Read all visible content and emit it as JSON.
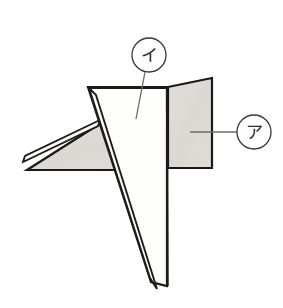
{
  "figure": {
    "canvas": {
      "width": 283,
      "height": 308,
      "background": "#ffffff"
    },
    "style": {
      "outline_color": "#1c1a18",
      "outline_width": 2.2,
      "thin_line_color": "#2b2825",
      "thin_line_width": 1.1,
      "shaded_fill": "#dedbd6",
      "white_fill": "#fdfdfc",
      "leader_color": "#6e6b67",
      "leader_width": 1.2,
      "circle_stroke": "#3a3734",
      "circle_stroke_width": 1.3
    },
    "parts": [
      {
        "id": "right-panel",
        "name": "right shaded panel",
        "fill": "shaded",
        "points": "168,87 212,78 212,168 168,168"
      },
      {
        "id": "left-wing",
        "name": "left shaded wing",
        "fill": "shaded",
        "points": "100,122 148,168 26,168"
      },
      {
        "id": "left-fold-sliver",
        "name": "left folded edge sliver",
        "fill": "white",
        "points": "99,120 24,158 22,163 97,127"
      },
      {
        "id": "center-face",
        "name": "central white triangular face",
        "fill": "white",
        "points": "88,87 167,87 167,285 152,283"
      },
      {
        "id": "tail-sliver",
        "name": "lower tail sliver",
        "fill": "white",
        "points": "90,89 150,281 156,286 96,93"
      }
    ],
    "callouts": [
      {
        "id": "callout-a",
        "label": "ア",
        "romaji": "a",
        "circle": {
          "cx": 254,
          "cy": 132,
          "r": 17
        },
        "leader": {
          "x1": 237,
          "y1": 132,
          "x2": 190,
          "y2": 132,
          "type": "straight"
        },
        "points_to": "right-panel"
      },
      {
        "id": "callout-i",
        "label": "イ",
        "romaji": "i",
        "circle": {
          "cx": 149,
          "cy": 55,
          "r": 17
        },
        "leader": {
          "x1": 145,
          "y1": 72,
          "x2": 136,
          "y2": 119,
          "type": "straight"
        },
        "points_to": "center-face"
      }
    ]
  }
}
